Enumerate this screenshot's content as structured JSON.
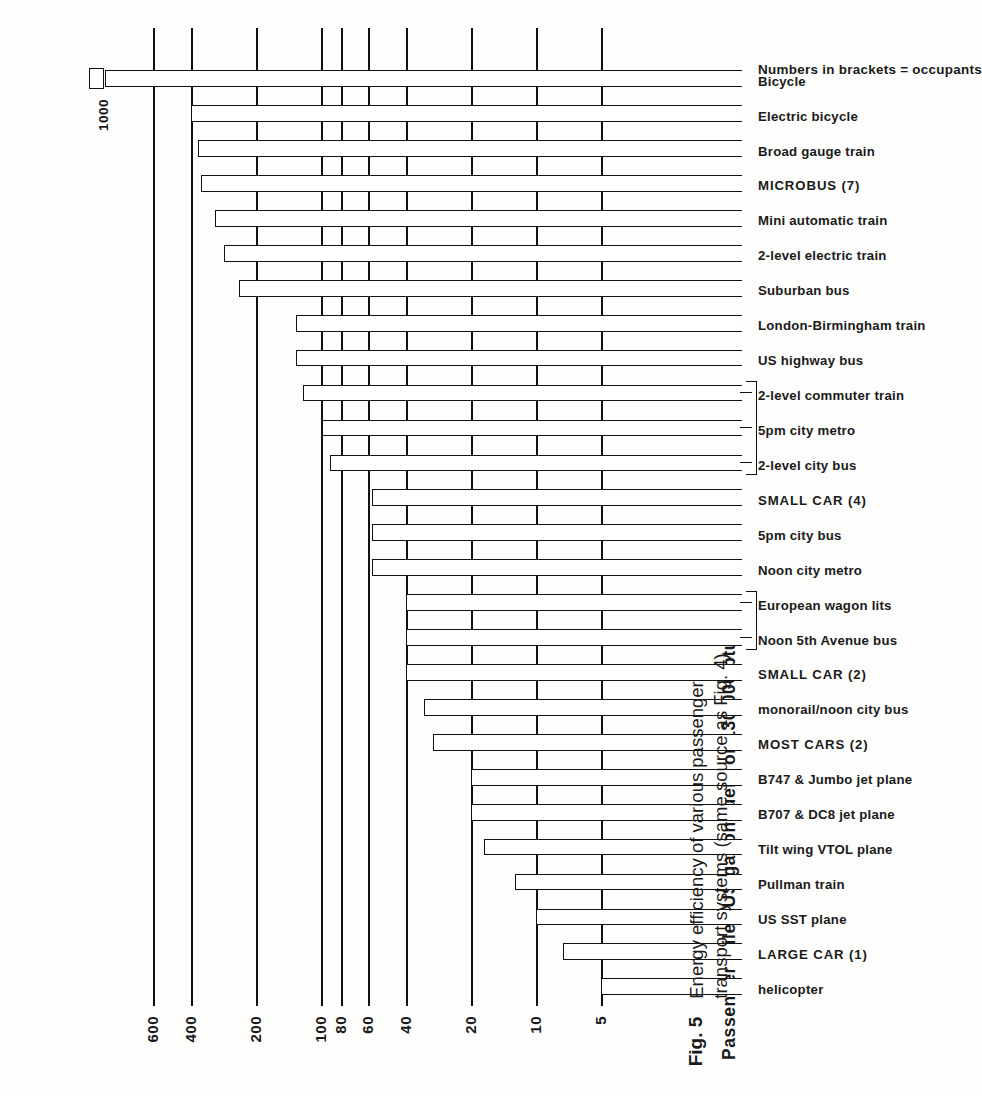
{
  "figure": {
    "number": "Fig. 5",
    "caption": "Energy efficiency of various passenger transport systems (same source as Fig. 4)",
    "note": "Numbers in brackets = occupants"
  },
  "chart_data": {
    "type": "bar",
    "orientation": "horizontal-rotated",
    "title": "",
    "xlabel": "",
    "ylabel": "Passenger miles/US gallon fuel ( or 130,000 btu)",
    "scale": "log",
    "ylim": [
      4,
      1100
    ],
    "grid": true,
    "legend": null,
    "tick_labels": [
      "5",
      "10",
      "20",
      "40",
      "60",
      "80",
      "100",
      "200",
      "400",
      "600"
    ],
    "tick_values": [
      5,
      10,
      20,
      40,
      60,
      80,
      100,
      200,
      400,
      600
    ],
    "extra_annotation": "1000",
    "categories": [
      "helicopter",
      "LARGE CAR (1)",
      "US SST plane",
      "Pullman train",
      "Tilt wing VTOL plane",
      "B707 & DC8 jet plane",
      "B747 & Jumbo jet plane",
      "MOST CARS (2)",
      "monorail/noon city bus",
      "SMALL CAR (2)",
      "Noon 5th Avenue bus",
      "European wagon lits",
      "Noon city metro",
      "5pm city bus",
      "SMALL CAR (4)",
      "2-level city bus",
      "5pm city metro",
      "2-level commuter train",
      "US highway bus",
      "London-Birmingham train",
      "Suburban bus",
      "2-level electric train",
      "Mini automatic train",
      "MICROBUS (7)",
      "Broad gauge train",
      "Electric bicycle",
      "Bicycle"
    ],
    "values": [
      5,
      7.5,
      10,
      12.5,
      17.5,
      20,
      20,
      30,
      33,
      40,
      40,
      40,
      58,
      58,
      58,
      90,
      98,
      120,
      130,
      130,
      240,
      280,
      310,
      360,
      370,
      400,
      1000
    ],
    "groups": [
      {
        "label": "SMALL CAR (2)",
        "members": [
          "Noon 5th Avenue bus",
          "European wagon lits"
        ]
      },
      {
        "label": "SMALL CAR (4)",
        "members": [
          "2-level city bus",
          "5pm city metro",
          "2-level commuter train"
        ]
      }
    ]
  }
}
